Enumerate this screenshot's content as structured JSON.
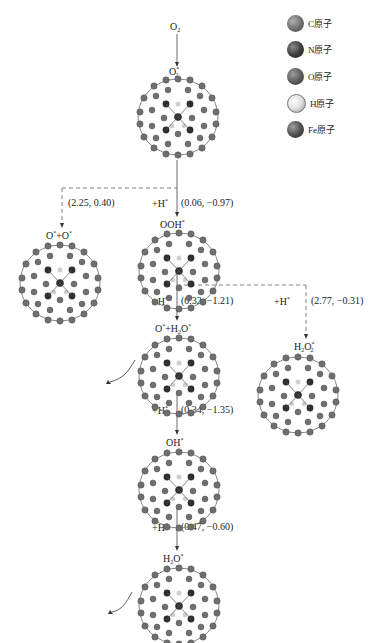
{
  "legend": [
    {
      "label": "C原子",
      "color": "#6e6e6e"
    },
    {
      "label": "N原子",
      "color": "#3a3a3a"
    },
    {
      "label": "O原子",
      "color": "#5a5a5a"
    },
    {
      "label": "H原子",
      "color": "#e6e6e6"
    },
    {
      "label": "Fe原子",
      "color": "#4a4a4a"
    }
  ],
  "species": {
    "o2": {
      "base": "O",
      "sub": "2",
      "sup": ""
    },
    "o2_ads": {
      "base": "O",
      "sub": "2",
      "sup": "*"
    },
    "o_o": {
      "text": "O*+O*"
    },
    "ooh": {
      "base": "OOH",
      "sup": "*"
    },
    "o_h2o": {
      "text": "O*+H2O*"
    },
    "h2o2": {
      "base": "H",
      "mid": "2",
      "base2": "O",
      "sub": "2",
      "sup": "*"
    },
    "oh": {
      "base": "OH",
      "sup": "*"
    },
    "h2o": {
      "base": "H",
      "mid": "2",
      "base2": "O",
      "sup": "*"
    }
  },
  "steps": [
    {
      "id": "s1",
      "reagent": "",
      "values": "(2.25, 0.40)",
      "style": "dashed"
    },
    {
      "id": "s2",
      "reagent": "+H*",
      "values": "(0.06, −0.97)",
      "style": "solid"
    },
    {
      "id": "s3",
      "reagent": "+H*",
      "values": "(0.32, −1.21)",
      "style": "solid"
    },
    {
      "id": "s4",
      "reagent": "+H*",
      "values": "(2.77, −0.31)",
      "style": "dashed"
    },
    {
      "id": "s5",
      "reagent": "+H*",
      "values": "(0.34, −1.35)",
      "style": "solid"
    },
    {
      "id": "s6",
      "reagent": "+H*",
      "values": "(0.47, −0.60)",
      "style": "solid"
    }
  ],
  "labels": {
    "plus_h": "+H",
    "star": "*"
  }
}
